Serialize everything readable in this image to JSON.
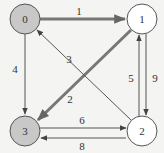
{
  "graph": {
    "directed": true,
    "colors": {
      "background": "#f4f4f2",
      "highlight_node_fill": "#c8c8c8",
      "normal_node_fill": "#ffffff",
      "stroke": "#555555",
      "highlight_edge": "#777777",
      "label": "#333333"
    },
    "nodes": [
      {
        "id": "0",
        "label": "0",
        "x": 25,
        "y": 19,
        "highlighted": true
      },
      {
        "id": "1",
        "label": "1",
        "x": 142,
        "y": 19,
        "highlighted": false
      },
      {
        "id": "2",
        "label": "2",
        "x": 142,
        "y": 131,
        "highlighted": false
      },
      {
        "id": "3",
        "label": "3",
        "x": 25,
        "y": 131,
        "highlighted": true
      }
    ],
    "edges": [
      {
        "from": "0",
        "to": "1",
        "weight": "1",
        "highlighted": true
      },
      {
        "from": "0",
        "to": "3",
        "weight": "4",
        "highlighted": false
      },
      {
        "from": "1",
        "to": "3",
        "weight": "2",
        "highlighted": true
      },
      {
        "from": "2",
        "to": "0",
        "weight": "3",
        "highlighted": false
      },
      {
        "from": "2",
        "to": "1",
        "weight": "5",
        "highlighted": false
      },
      {
        "from": "1",
        "to": "2",
        "weight": "9",
        "highlighted": false
      },
      {
        "from": "3",
        "to": "2",
        "weight": "6",
        "highlighted": false
      },
      {
        "from": "2",
        "to": "3",
        "weight": "8",
        "highlighted": false
      }
    ]
  }
}
